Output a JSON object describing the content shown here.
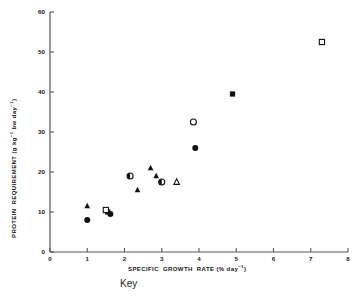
{
  "chart_data": {
    "type": "scatter",
    "title": "",
    "xlabel": "SPECIFIC  GROWTH  RATE (% day⁻¹)",
    "ylabel": "PROTEIN  REQUIREMENT (g kg⁻¹ bw day⁻¹)",
    "xlim": [
      0,
      8
    ],
    "ylim": [
      0,
      60
    ],
    "xticks": [
      0,
      1,
      2,
      3,
      4,
      5,
      6,
      7,
      8
    ],
    "yticks": [
      0,
      10,
      20,
      30,
      40,
      50,
      60
    ],
    "xtick_labels": [
      "0",
      "1",
      "2",
      "3",
      "4",
      "5",
      "6",
      "7",
      "8"
    ],
    "ytick_labels": [
      "0",
      "10",
      "20",
      "30",
      "40",
      "50",
      "60"
    ],
    "grid": false,
    "legend_position": "none",
    "series": [
      {
        "name": "filled-circle",
        "marker": "filled-circle",
        "points": [
          {
            "x": 1.0,
            "y": 8.0
          },
          {
            "x": 3.9,
            "y": 26.0
          }
        ]
      },
      {
        "name": "half-filled-circle",
        "marker": "half-filled-circle",
        "points": [
          {
            "x": 2.15,
            "y": 19.0
          },
          {
            "x": 3.0,
            "y": 17.5
          }
        ]
      },
      {
        "name": "open-circle",
        "marker": "open-circle",
        "points": [
          {
            "x": 3.85,
            "y": 32.5
          }
        ]
      },
      {
        "name": "filled-triangle",
        "marker": "filled-triangle",
        "points": [
          {
            "x": 1.0,
            "y": 11.5
          },
          {
            "x": 2.35,
            "y": 15.5
          },
          {
            "x": 2.7,
            "y": 21.0
          },
          {
            "x": 2.85,
            "y": 19.0
          }
        ]
      },
      {
        "name": "open-triangle",
        "marker": "open-triangle",
        "points": [
          {
            "x": 3.4,
            "y": 17.5
          }
        ]
      },
      {
        "name": "filled-square",
        "marker": "filled-square",
        "points": [
          {
            "x": 4.9,
            "y": 39.5
          },
          {
            "x": 1.55,
            "y": 10.0
          }
        ]
      },
      {
        "name": "open-square",
        "marker": "open-square",
        "points": [
          {
            "x": 7.3,
            "y": 52.5
          },
          {
            "x": 1.5,
            "y": 10.5
          }
        ]
      },
      {
        "name": "cluster-extra",
        "marker": "filled-circle",
        "points": [
          {
            "x": 1.62,
            "y": 9.5
          }
        ]
      }
    ]
  },
  "key": {
    "label": "Key"
  }
}
